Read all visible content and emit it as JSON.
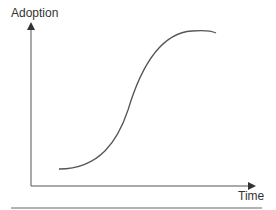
{
  "diagram": {
    "y_axis_label": "Adoption",
    "x_axis_label": "Time",
    "colors": {
      "axis": "#444444",
      "curve": "#555555",
      "rule": "#999999"
    },
    "curve_type": "sigmoid"
  }
}
